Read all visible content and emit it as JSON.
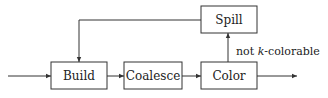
{
  "nodes": {
    "build": {
      "label": "Build"
    },
    "coalesce": {
      "label": "Coalesce"
    },
    "color": {
      "label": "Color"
    },
    "spill": {
      "label": "Spill"
    }
  },
  "edges": {
    "color_to_spill": {
      "label_prefix": "not ",
      "label_var": "k",
      "label_suffix": "-colorable"
    }
  },
  "colors": {
    "stroke": "#333333",
    "text": "#222222"
  }
}
